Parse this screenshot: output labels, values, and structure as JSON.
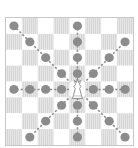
{
  "diagram": {
    "board": {
      "files": [
        "a",
        "b",
        "c",
        "d",
        "e",
        "f",
        "g",
        "h"
      ],
      "ranks": [
        "8",
        "7",
        "6",
        "5",
        "4",
        "3",
        "2",
        "1"
      ],
      "light_color": "#ffffff",
      "dark_color": "#dcdcdc"
    },
    "piece": {
      "type": "queen",
      "color": "white",
      "square": "e4"
    },
    "move_marker_color": "#8c8c8c",
    "legal_moves": [
      "e8",
      "e7",
      "e6",
      "e5",
      "e3",
      "e2",
      "e1",
      "a4",
      "b4",
      "c4",
      "d4",
      "f4",
      "g4",
      "h4",
      "a8",
      "b7",
      "c6",
      "d5",
      "f3",
      "g2",
      "h1",
      "h7",
      "g6",
      "f5",
      "d3",
      "c2",
      "b1"
    ]
  }
}
